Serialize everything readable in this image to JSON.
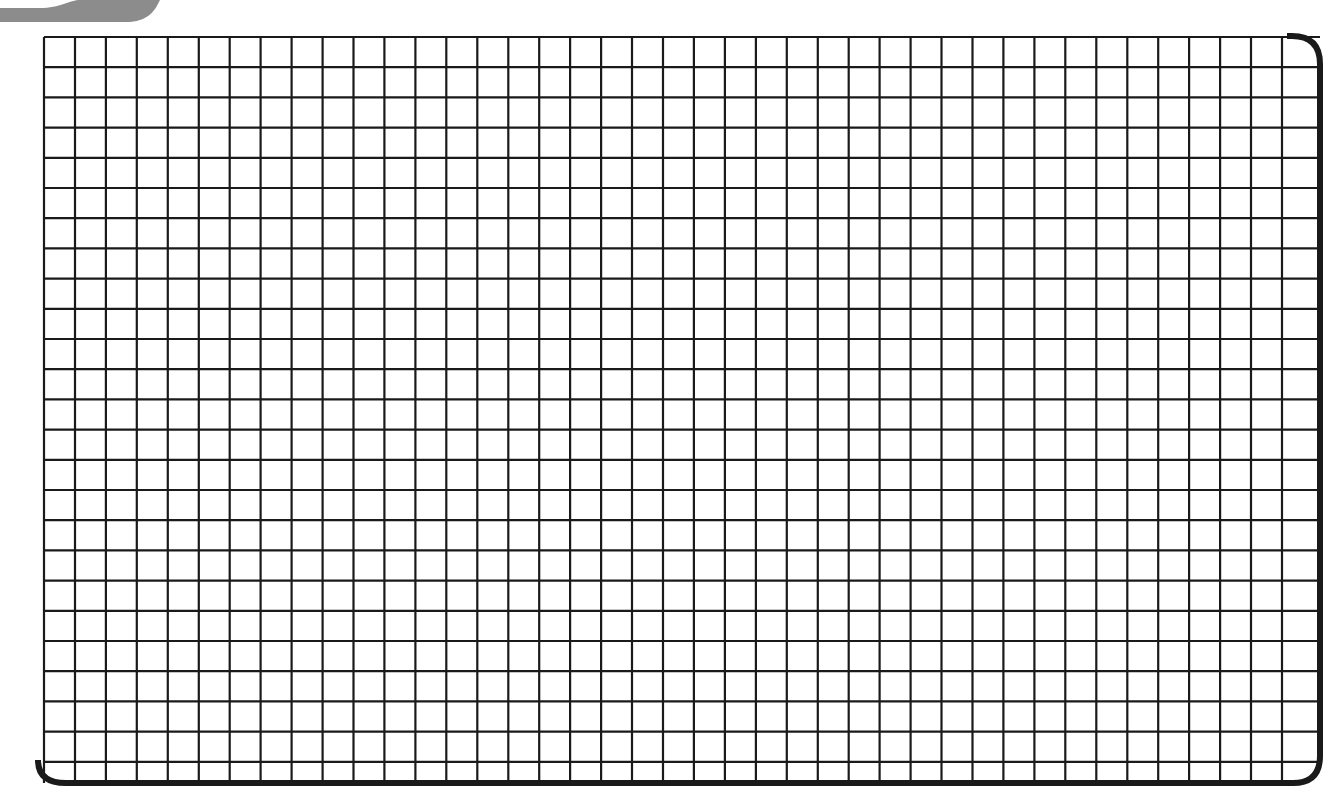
{
  "graph_paper": {
    "columns": 41,
    "rows": 24,
    "origin_x": 44,
    "origin_y": 37,
    "cell_width": 30.95,
    "cell_height": 30.2,
    "grid_line_color": "#1a1a1a",
    "border_color": "#1a1a1a",
    "background_color": "#ffffff",
    "swoosh_color": "#8a8a8a"
  }
}
